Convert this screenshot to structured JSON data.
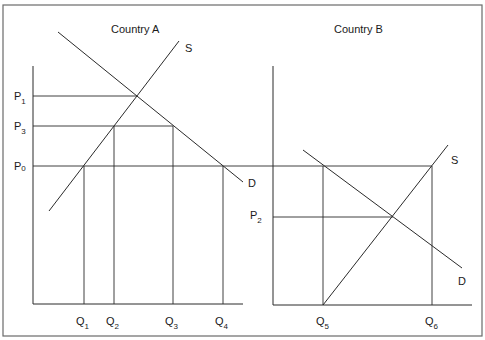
{
  "panels": [
    {
      "title": "Country A",
      "price_labels": [
        {
          "main": "P",
          "sub": "1"
        },
        {
          "main": "P",
          "sub": "3"
        },
        {
          "main": "P",
          "sub": "0"
        }
      ],
      "quantity_labels": [
        {
          "main": "Q",
          "sub": "1"
        },
        {
          "main": "Q",
          "sub": "2"
        },
        {
          "main": "Q",
          "sub": "3"
        },
        {
          "main": "Q",
          "sub": "4"
        }
      ],
      "curves": {
        "supply": "S",
        "demand": "D"
      }
    },
    {
      "title": "Country B",
      "price_labels": [
        {
          "main": "P",
          "sub": "2"
        }
      ],
      "quantity_labels": [
        {
          "main": "Q",
          "sub": "5"
        },
        {
          "main": "Q",
          "sub": "6"
        }
      ],
      "curves": {
        "supply": "S",
        "demand": "D"
      }
    }
  ],
  "colors": {
    "line": "#2a2a2a",
    "frame": "#6a6a6a",
    "background": "#ffffff"
  }
}
